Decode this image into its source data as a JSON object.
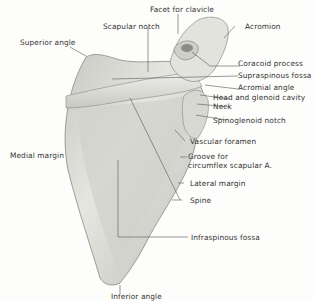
{
  "figure": {
    "background": "#fdfdfb",
    "bone_color": "#dcdcd6",
    "line_color": "#555555"
  },
  "labels": {
    "facet_for_clavicle": "Facet for clavicle",
    "acromion": "Acromion",
    "scapular_notch": "Scapular notch",
    "superior_angle": "Superior angle",
    "coracoid_process": "Coracoid process",
    "supraspinous_fossa": "Supraspinous fossa",
    "acromial_angle": "Acromial angle",
    "head_and_glenoid_cavity": "Head and glenoid cavity",
    "neck": "Neck",
    "spinoglenoid_notch": "Spinoglenoid notch",
    "vascular_foramen": "Vascular foramen",
    "groove_for_line1": "Groove for",
    "groove_for_line2": "circumflex scapular A.",
    "medial_margin": "Medial margin",
    "lateral_margin": "Lateral margin",
    "spine": "Spine",
    "infraspinous_fossa": "Infraspinous fossa",
    "inferior_angle": "Inferior angle"
  }
}
